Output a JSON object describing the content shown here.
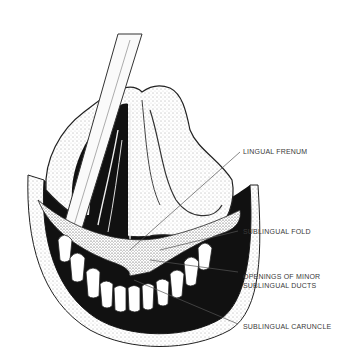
{
  "figure": {
    "labels": [
      {
        "id": "lingual-frenum",
        "lines": [
          "LINGUAL FRENUM"
        ]
      },
      {
        "id": "sublingual-fold",
        "lines": [
          "SUBLINGUAL FOLD"
        ]
      },
      {
        "id": "openings-minor-sublingual-ducts",
        "lines": [
          "OPENINGS OF MINOR",
          "SUBLINGUAL DUCTS"
        ]
      },
      {
        "id": "sublingual-caruncle",
        "lines": [
          "SUBLINGUAL CARUNCLE"
        ]
      }
    ],
    "colors": {
      "ink": "#1a1a1a",
      "label": "#3a3a3a",
      "background": "#ffffff"
    }
  }
}
